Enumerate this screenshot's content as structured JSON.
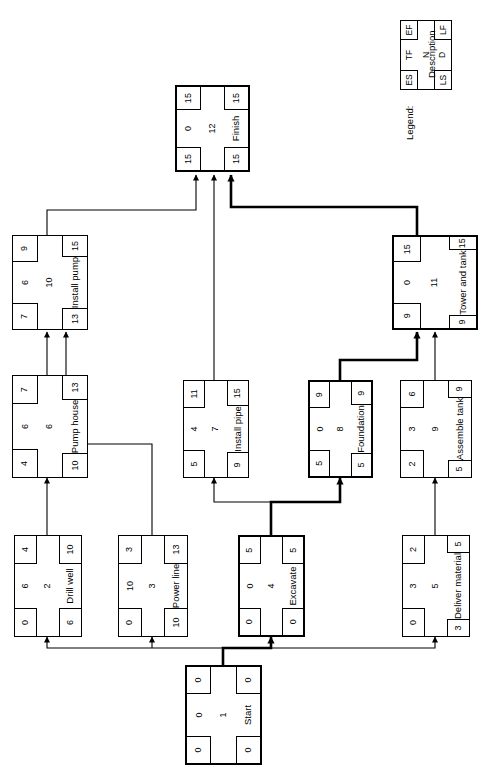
{
  "diagram": {
    "orientation": "rotated-90",
    "legend": {
      "caption": "Legend:",
      "es": "ES",
      "tf": "TF",
      "ef": "EF",
      "n": "N",
      "description": "Description",
      "ls": "LS",
      "d": "D",
      "lf": "LF"
    },
    "nodes": [
      {
        "id": "start",
        "name": "Start",
        "n": "1",
        "es": "0",
        "tf": "0",
        "ef": "0",
        "ls": "0",
        "d": "0",
        "lf": "0",
        "critical": true
      },
      {
        "id": "drill-well",
        "name": "Drill well",
        "n": "2",
        "es": "0",
        "tf": "6",
        "ef": "4",
        "ls": "6",
        "d": "4",
        "lf": "10",
        "critical": false
      },
      {
        "id": "power-line",
        "name": "Power line",
        "n": "3",
        "es": "0",
        "tf": "10",
        "ef": "3",
        "ls": "10",
        "d": "3",
        "lf": "13",
        "critical": false
      },
      {
        "id": "excavate",
        "name": "Excavate",
        "n": "4",
        "es": "0",
        "tf": "0",
        "ef": "5",
        "ls": "0",
        "d": "5",
        "lf": "5",
        "critical": true
      },
      {
        "id": "deliver-material",
        "name": "Deliver material",
        "n": "5",
        "es": "0",
        "tf": "3",
        "ef": "2",
        "ls": "3",
        "d": "2",
        "lf": "5",
        "critical": false
      },
      {
        "id": "pump-house",
        "name": "Pump house",
        "n": "6",
        "es": "4",
        "tf": "6",
        "ef": "7",
        "ls": "10",
        "d": "3",
        "lf": "13",
        "critical": false
      },
      {
        "id": "install-pipe",
        "name": "Install pipe",
        "n": "7",
        "es": "5",
        "tf": "4",
        "ef": "11",
        "ls": "9",
        "d": "6",
        "lf": "15",
        "critical": false
      },
      {
        "id": "foundation",
        "name": "Foundation",
        "n": "8",
        "es": "5",
        "tf": "0",
        "ef": "9",
        "ls": "5",
        "d": "4",
        "lf": "9",
        "critical": true
      },
      {
        "id": "assemble-tank",
        "name": "Assemble tank",
        "n": "9",
        "es": "2",
        "tf": "3",
        "ef": "6",
        "ls": "5",
        "d": "4",
        "lf": "9",
        "critical": false
      },
      {
        "id": "install-pump",
        "name": "Install pump",
        "n": "10",
        "es": "7",
        "tf": "6",
        "ef": "9",
        "ls": "13",
        "d": "2",
        "lf": "15",
        "critical": false
      },
      {
        "id": "tower-and-tank",
        "name": "Tower and tank",
        "n": "11",
        "es": "9",
        "tf": "0",
        "ef": "15",
        "ls": "9",
        "d": "6",
        "lf": "15",
        "critical": true
      },
      {
        "id": "finish",
        "name": "Finish",
        "n": "12",
        "es": "15",
        "tf": "0",
        "ef": "15",
        "ls": "15",
        "d": "0",
        "lf": "15",
        "critical": true
      }
    ],
    "edges": [
      {
        "from": "start",
        "to": "drill-well",
        "critical": false
      },
      {
        "from": "start",
        "to": "power-line",
        "critical": false
      },
      {
        "from": "start",
        "to": "excavate",
        "critical": true
      },
      {
        "from": "start",
        "to": "deliver-material",
        "critical": false
      },
      {
        "from": "drill-well",
        "to": "pump-house",
        "critical": false
      },
      {
        "from": "excavate",
        "to": "install-pipe",
        "critical": false
      },
      {
        "from": "excavate",
        "to": "foundation",
        "critical": true
      },
      {
        "from": "deliver-material",
        "to": "assemble-tank",
        "critical": false
      },
      {
        "from": "pump-house",
        "to": "install-pump",
        "critical": false
      },
      {
        "from": "power-line",
        "to": "install-pump",
        "critical": false
      },
      {
        "from": "foundation",
        "to": "tower-and-tank",
        "critical": true
      },
      {
        "from": "assemble-tank",
        "to": "tower-and-tank",
        "critical": false
      },
      {
        "from": "install-pump",
        "to": "finish",
        "critical": false
      },
      {
        "from": "install-pipe",
        "to": "finish",
        "critical": false
      },
      {
        "from": "tower-and-tank",
        "to": "finish",
        "critical": true
      }
    ]
  }
}
